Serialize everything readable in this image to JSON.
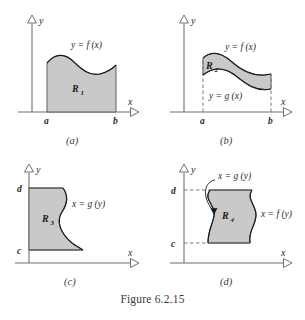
{
  "figure": {
    "caption": "Figure 6.2.15",
    "axis_y_label": "y",
    "axis_x_label": "x"
  },
  "panels": [
    {
      "id": "a",
      "subcaption": "(a)",
      "region_label": "R",
      "region_sub": "1",
      "curve_labels": [
        "y = f (x)"
      ],
      "tick_labels": {
        "x": [
          "a",
          "b"
        ],
        "y": []
      },
      "axis_y_label": "y",
      "axis_x_label": "x"
    },
    {
      "id": "b",
      "subcaption": "(b)",
      "region_label": "R",
      "region_sub": "2",
      "curve_labels": [
        "y = f (x)",
        "y = g (x)"
      ],
      "tick_labels": {
        "x": [
          "a",
          "b"
        ],
        "y": []
      },
      "axis_y_label": "y",
      "axis_x_label": "x"
    },
    {
      "id": "c",
      "subcaption": "(c)",
      "region_label": "R",
      "region_sub": "3",
      "curve_labels": [
        "x = g (y)"
      ],
      "tick_labels": {
        "x": [],
        "y": [
          "d",
          "c"
        ]
      },
      "axis_y_label": "y",
      "axis_x_label": "x"
    },
    {
      "id": "d",
      "subcaption": "(d)",
      "region_label": "R",
      "region_sub": "4",
      "curve_labels": [
        "x = g (y)",
        "x = f (y)"
      ],
      "tick_labels": {
        "x": [],
        "y": [
          "d",
          "c"
        ]
      },
      "axis_y_label": "y",
      "axis_x_label": "x"
    }
  ],
  "colors": {
    "region_fill": "#c9c9c9",
    "region_stroke": "#4f4f4f",
    "curve": "#1c1c1c",
    "axis": "#6f6f6f",
    "text": "#2b2b2b",
    "background": "#ffffff"
  }
}
